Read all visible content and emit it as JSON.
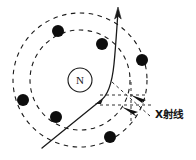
{
  "figure": {
    "background_color": "#ffffff",
    "stroke_color": "#1a1a1a",
    "width": 196,
    "height": 160
  },
  "nucleus": {
    "label": "N",
    "center_x": 80,
    "center_y": 80,
    "radius": 12
  },
  "shells": [
    {
      "name": "inner-shell",
      "center_x": 80,
      "center_y": 80,
      "radius": 50,
      "style": "dashed"
    },
    {
      "name": "outer-shell",
      "center_x": 80,
      "center_y": 80,
      "radius": 67,
      "style": "dashed"
    }
  ],
  "electrons": [
    {
      "name": "electron-upper-left",
      "x": 58,
      "y": 31,
      "r": 6
    },
    {
      "name": "electron-upper-mid",
      "x": 102,
      "y": 44,
      "r": 6
    },
    {
      "name": "electron-right",
      "x": 142,
      "y": 60,
      "r": 6
    },
    {
      "name": "electron-left",
      "x": 23,
      "y": 100,
      "r": 6
    },
    {
      "name": "electron-lower-left",
      "x": 56,
      "y": 117,
      "r": 6
    },
    {
      "name": "electron-bottom",
      "x": 110,
      "y": 137,
      "r": 6
    }
  ],
  "trajectory": {
    "name": "scattered-particle-path",
    "description": "Incident particle path deflected near the nucleus, exiting upward with arrowhead",
    "path": "M 42 148 L 100 101",
    "curve_path": "M 100 101 C 108 96 112 84 114 64 C 116 44 117 24 118 12",
    "arrow_tip_x": 118,
    "arrow_tip_y": 8,
    "scatter_point_x": 100,
    "scatter_point_y": 101
  },
  "xray": {
    "label": "X射线",
    "label_x": 155,
    "label_y": 118,
    "construction_lines": [
      {
        "name": "xray-dash-horizontal-upper",
        "x1": 100,
        "y1": 95,
        "x2": 146,
        "y2": 95
      },
      {
        "name": "xray-dash-horizontal-lower",
        "x1": 100,
        "y1": 105,
        "x2": 152,
        "y2": 105
      },
      {
        "name": "xray-dash-vertical",
        "x1": 131,
        "y1": 82,
        "x2": 131,
        "y2": 122
      },
      {
        "name": "xray-dash-diagonal",
        "x1": 112,
        "y1": 82,
        "x2": 150,
        "y2": 116
      }
    ],
    "arrows": [
      {
        "name": "xray-arrow-upper",
        "x": 143,
        "y": 98,
        "angle": 200
      },
      {
        "name": "xray-arrow-lower",
        "x": 136,
        "y": 112,
        "angle": 200
      }
    ]
  }
}
